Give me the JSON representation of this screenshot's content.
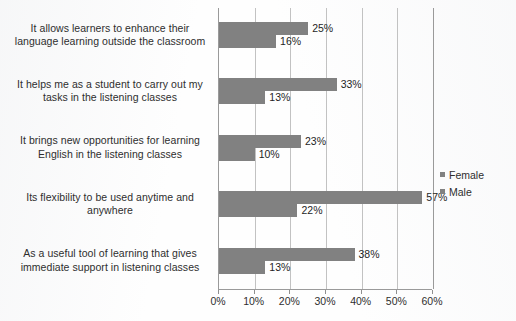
{
  "chart_data": {
    "type": "bar",
    "orientation": "horizontal",
    "title": "",
    "xlabel": "",
    "ylabel": "",
    "xlim": [
      0,
      60
    ],
    "grid": true,
    "legend_position": "right",
    "categories": [
      "It allows learners to enhance their language learning outside the classroom",
      "It helps me as a student to carry out my tasks in the listening classes",
      "It brings new opportunities for learning English in the listening classes",
      "Its flexibility to be used anytime and anywhere",
      "As a useful tool of learning that gives immediate support in listening classes"
    ],
    "category_lines": [
      [
        "It allows learners to enhance their",
        "language learning outside the classroom"
      ],
      [
        "It helps me as a student to carry out my",
        "tasks in the listening classes"
      ],
      [
        "It brings new opportunities for learning",
        "English in the listening classes"
      ],
      [
        "Its flexibility to be used anytime and",
        "anywhere"
      ],
      [
        "As a useful tool of learning that gives",
        "immediate support in listening classes"
      ]
    ],
    "series": [
      {
        "name": "Female",
        "color": "#818181",
        "values": [
          25,
          33,
          23,
          57,
          38
        ],
        "labels": [
          "25%",
          "33%",
          "23%",
          "57%",
          "38%"
        ]
      },
      {
        "name": "Male",
        "color": "#818181",
        "values": [
          16,
          13,
          10,
          22,
          13
        ],
        "labels": [
          "16%",
          "13%",
          "10%",
          "22%",
          "13%"
        ]
      }
    ],
    "xticks": [
      0,
      10,
      20,
      30,
      40,
      50,
      60
    ],
    "xtick_labels": [
      "0%",
      "10%",
      "20%",
      "30%",
      "40%",
      "50%",
      "60%"
    ]
  },
  "legend": {
    "entries": [
      {
        "label": "Female",
        "color": "#818181"
      },
      {
        "label": "Male",
        "color": "#818181"
      }
    ]
  },
  "caption": {
    "text": ""
  }
}
